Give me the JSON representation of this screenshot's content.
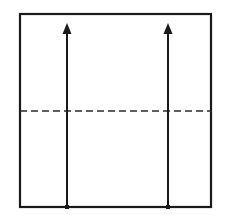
{
  "figure": {
    "type": "engineering-diagram",
    "canvas": {
      "width": 226,
      "height": 224,
      "background": "#ffffff"
    },
    "colors": {
      "stroke": "#1a1a1a",
      "centerline": "#2b2b2b",
      "background": "#ffffff"
    },
    "rectangle": {
      "name": "outer-rectangle",
      "x": 20,
      "y": 14,
      "width": 191,
      "height": 193,
      "stroke_width": 2.2,
      "fill": "none"
    },
    "centerline": {
      "name": "horizontal-centerline",
      "x1": 20,
      "x2": 211,
      "y": 111,
      "stroke_width": 1.6,
      "dash_pattern": "7 4",
      "style": "dashed"
    },
    "arrows": [
      {
        "name": "left-arrow",
        "x": 67,
        "y_tail": 207,
        "y_tip": 23,
        "stroke_width": 2.0,
        "head_width": 9,
        "head_length": 11,
        "tail_marker": "dot",
        "tail_marker_size": 4.0,
        "direction": "up"
      },
      {
        "name": "right-arrow",
        "x": 168,
        "y_tail": 207,
        "y_tip": 23,
        "stroke_width": 2.0,
        "head_width": 9,
        "head_length": 11,
        "tail_marker": "dot",
        "tail_marker_size": 4.0,
        "direction": "up"
      }
    ],
    "labels": []
  }
}
